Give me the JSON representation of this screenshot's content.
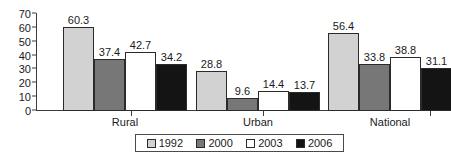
{
  "chart_data": {
    "type": "bar",
    "title": "",
    "xlabel": "",
    "ylabel": "",
    "categories": [
      "Rural",
      "Urban",
      "National"
    ],
    "series": [
      {
        "name": "1992",
        "color": "#d2d2d2",
        "values": [
          60.3,
          28.8,
          56.4
        ]
      },
      {
        "name": "2000",
        "color": "#777777",
        "values": [
          37.4,
          9.6,
          33.8
        ]
      },
      {
        "name": "2003",
        "color": "#ffffff",
        "values": [
          42.7,
          14.4,
          38.8
        ]
      },
      {
        "name": "2006",
        "color": "#141414",
        "values": [
          34.2,
          13.7,
          31.1
        ]
      }
    ],
    "ylim": [
      0,
      70
    ],
    "yticks": [
      0,
      10,
      20,
      30,
      40,
      50,
      60,
      70
    ],
    "ytick_labels": [
      "0",
      "10",
      "20",
      "30",
      "40",
      "50",
      "60",
      "70"
    ],
    "grid": false,
    "legend_position": "bottom",
    "data_labels": true,
    "data_label_text": [
      [
        "60.3",
        "37.4",
        "42.7",
        "34.2"
      ],
      [
        "28.8",
        "9.6",
        "14.4",
        "13.7"
      ],
      [
        "56.4",
        "33.8",
        "38.8",
        "31.1"
      ]
    ]
  },
  "legend": {
    "items": [
      {
        "label": "1992"
      },
      {
        "label": "2000"
      },
      {
        "label": "2003"
      },
      {
        "label": "2006"
      }
    ]
  }
}
